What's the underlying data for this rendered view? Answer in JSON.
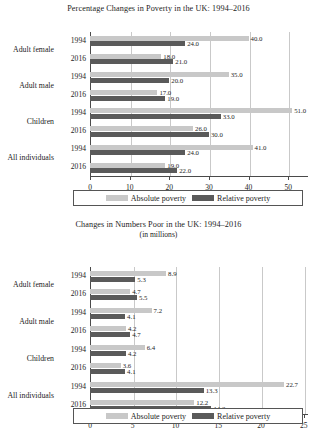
{
  "charts": [
    {
      "id": "percentage-changes",
      "title": "Percentage Changes in Poverty in the UK: 1994–2016",
      "subtitle": "",
      "legend": {
        "absolute": "Absolute poverty",
        "relative": "Relative poverty"
      },
      "chart_data": {
        "type": "bar",
        "orientation": "horizontal",
        "title": "Percentage Changes in Poverty in the UK: 1994–2016",
        "xlabel": "",
        "ylabel": "",
        "xlim": [
          0,
          55
        ],
        "xticks": [
          0,
          10,
          20,
          30,
          40,
          50
        ],
        "xticklabels": [
          "0",
          "10",
          "20",
          "30",
          "40",
          "50"
        ],
        "grid": true,
        "legend_position": "bottom",
        "categories": [
          "Adult female",
          "Adult male",
          "Children",
          "All individuals"
        ],
        "years": [
          "1994",
          "2016"
        ],
        "series": [
          {
            "name": "Absolute poverty",
            "color": "#c8c8c8",
            "values": [
              40.0,
              18.0,
              35.0,
              17.0,
              51.0,
              26.0,
              41.0,
              19.0
            ]
          },
          {
            "name": "Relative poverty",
            "color": "#5a5a5a",
            "values": [
              24.0,
              21.0,
              20.0,
              19.0,
              33.0,
              30.0,
              24.0,
              22.0
            ]
          }
        ],
        "groups": [
          {
            "category": "Adult female",
            "year": "1994",
            "absolute": 40.0,
            "relative": 24.0
          },
          {
            "category": "Adult female",
            "year": "2016",
            "absolute": 18.0,
            "relative": 21.0
          },
          {
            "category": "Adult male",
            "year": "1994",
            "absolute": 35.0,
            "relative": 20.0
          },
          {
            "category": "Adult male",
            "year": "2016",
            "absolute": 17.0,
            "relative": 19.0
          },
          {
            "category": "Children",
            "year": "1994",
            "absolute": 51.0,
            "relative": 33.0
          },
          {
            "category": "Children",
            "year": "2016",
            "absolute": 26.0,
            "relative": 30.0
          },
          {
            "category": "All individuals",
            "year": "1994",
            "absolute": 41.0,
            "relative": 24.0
          },
          {
            "category": "All individuals",
            "year": "2016",
            "absolute": 19.0,
            "relative": 22.0
          }
        ],
        "label_format": "one-decimal"
      }
    },
    {
      "id": "numbers-poor",
      "title": "Changes in Numbers Poor in the UK: 1994–2016",
      "subtitle": "(in millions)",
      "legend": {
        "absolute": "Absolute poverty",
        "relative": "Relative poverty"
      },
      "chart_data": {
        "type": "bar",
        "orientation": "horizontal",
        "title": "Changes in Numbers Poor in the UK: 1994–2016",
        "subtitle": "(in millions)",
        "xlabel": "",
        "ylabel": "",
        "xlim": [
          0,
          25.5
        ],
        "xticks": [
          0,
          5,
          10,
          15,
          20,
          25
        ],
        "xticklabels": [
          "0",
          "5",
          "10",
          "15",
          "20",
          "25"
        ],
        "grid": true,
        "legend_position": "bottom",
        "categories": [
          "Adult female",
          "Adult male",
          "Children",
          "All individuals"
        ],
        "years": [
          "1994",
          "2016"
        ],
        "series": [
          {
            "name": "Absolute poverty",
            "color": "#c8c8c8",
            "values": [
              8.9,
              4.7,
              7.2,
              4.2,
              6.4,
              3.6,
              22.7,
              12.2
            ]
          },
          {
            "name": "Relative poverty",
            "color": "#5a5a5a",
            "values": [
              5.3,
              5.5,
              4.1,
              4.7,
              4.2,
              4.1,
              13.3,
              14.2
            ]
          }
        ],
        "groups": [
          {
            "category": "Adult female",
            "year": "1994",
            "absolute": 8.9,
            "relative": 5.3
          },
          {
            "category": "Adult female",
            "year": "2016",
            "absolute": 4.7,
            "relative": 5.5
          },
          {
            "category": "Adult male",
            "year": "1994",
            "absolute": 7.2,
            "relative": 4.1
          },
          {
            "category": "Adult male",
            "year": "2016",
            "absolute": 4.2,
            "relative": 4.7
          },
          {
            "category": "Children",
            "year": "1994",
            "absolute": 6.4,
            "relative": 4.2
          },
          {
            "category": "Children",
            "year": "2016",
            "absolute": 3.6,
            "relative": 4.1
          },
          {
            "category": "All individuals",
            "year": "1994",
            "absolute": 22.7,
            "relative": 13.3
          },
          {
            "category": "All individuals",
            "year": "2016",
            "absolute": 12.2,
            "relative": 14.2
          }
        ],
        "label_format": "one-decimal"
      }
    }
  ],
  "colors": {
    "absolute": "#c8c8c8",
    "relative": "#5a5a5a",
    "axis": "#4a4a4a",
    "grid": "#c9c9c9",
    "text": "#1d1d1d"
  }
}
